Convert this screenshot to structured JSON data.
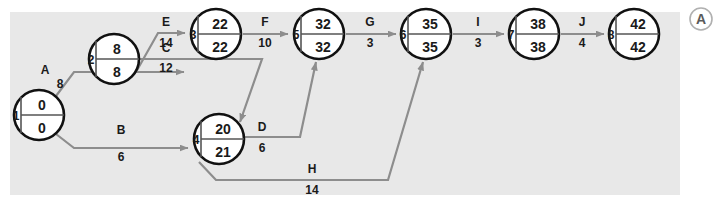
{
  "panel": {
    "background_color": "#e8e8e8",
    "page_background_color": "#ffffff"
  },
  "badge": {
    "label": "A",
    "name": "figure-part-badge",
    "color": "#5a5a5a"
  },
  "diagram": {
    "type": "pert-cpm-network",
    "node_fill": "#ffffff",
    "node_stroke": "#111111",
    "edge_color": "#8d8d8d",
    "nodes": [
      {
        "id": "1",
        "number": "1",
        "early": "0",
        "late": "0",
        "cx": 39,
        "cy": 115
      },
      {
        "id": "2",
        "number": "2",
        "early": "8",
        "late": "8",
        "cx": 114,
        "cy": 59
      },
      {
        "id": "3",
        "number": "3",
        "early": "22",
        "late": "22",
        "cx": 216,
        "cy": 34
      },
      {
        "id": "4",
        "number": "4",
        "early": "20",
        "late": "21",
        "cx": 219,
        "cy": 139
      },
      {
        "id": "5",
        "number": "5",
        "early": "32",
        "late": "32",
        "cx": 319,
        "cy": 34
      },
      {
        "id": "6",
        "number": "6",
        "early": "35",
        "late": "35",
        "cx": 426,
        "cy": 34
      },
      {
        "id": "7",
        "number": "7",
        "early": "38",
        "late": "38",
        "cx": 534,
        "cy": 34
      },
      {
        "id": "8",
        "number": "8",
        "early": "42",
        "late": "42",
        "cx": 634,
        "cy": 34
      }
    ],
    "edges": [
      {
        "name": "A",
        "duration": "8",
        "from": "1",
        "to": "2"
      },
      {
        "name": "B",
        "duration": "6",
        "from": "1",
        "to": "4"
      },
      {
        "name": "E",
        "duration": "14",
        "from": "2",
        "to": "3"
      },
      {
        "name": "C",
        "duration": "12",
        "from": "2",
        "to": "4"
      },
      {
        "name": "F",
        "duration": "10",
        "from": "3",
        "to": "5"
      },
      {
        "name": "D",
        "duration": "6",
        "from": "4",
        "to": "5"
      },
      {
        "name": "H",
        "duration": "14",
        "from": "4",
        "to": "6"
      },
      {
        "name": "G",
        "duration": "3",
        "from": "5",
        "to": "6"
      },
      {
        "name": "I",
        "duration": "3",
        "from": "6",
        "to": "7"
      },
      {
        "name": "J",
        "duration": "4",
        "from": "7",
        "to": "8"
      }
    ]
  }
}
